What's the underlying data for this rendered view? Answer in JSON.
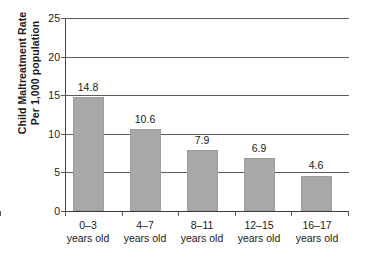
{
  "chart_data": {
    "type": "bar",
    "title": "",
    "subtitle": "",
    "xlabel": "",
    "ylabel_lines": [
      "Child Maltreatment Rate",
      "Per 1,000 population"
    ],
    "ylabel": "Child Maltreatment Rate Per 1,000 population",
    "categories": [
      "0–3\nyears old",
      "4–7\nyears old",
      "8–11\nyears old",
      "12–15\nyears old",
      "16–17\nyears old"
    ],
    "category_lines": [
      [
        "0–3",
        "years old"
      ],
      [
        "4–7",
        "years old"
      ],
      [
        "8–11",
        "years old"
      ],
      [
        "12–15",
        "years old"
      ],
      [
        "16–17",
        "years old"
      ]
    ],
    "values": [
      14.8,
      10.6,
      7.9,
      6.9,
      4.6
    ],
    "value_labels": [
      "14.8",
      "10.6",
      "7.9",
      "6.9",
      "4.6"
    ],
    "ylim": [
      0,
      25
    ],
    "yticks": [
      0,
      5,
      10,
      15,
      20,
      25
    ],
    "ytick_labels": [
      "0",
      "5",
      "10",
      "15",
      "20",
      "25"
    ],
    "grid": true,
    "grid_axis": "y",
    "legend": false,
    "legend_position": "none",
    "bar_color": "#a8a8a8",
    "gridline_color": "#5a5a5a",
    "axis_color": "#3c3c3c",
    "text_color": "#1a1a1a",
    "background": "#ffffff"
  }
}
